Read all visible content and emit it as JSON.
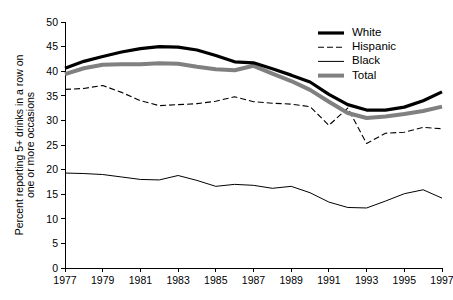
{
  "chart_data": {
    "type": "line",
    "title": "",
    "xlabel": "",
    "ylabel": "Percent reporting 5+ drinks in a row on one or more occasions",
    "ylabel_line1": "Percent reporting 5+ drinks in a row on",
    "ylabel_line2": "one or more occasions",
    "x": [
      1977,
      1978,
      1979,
      1980,
      1981,
      1982,
      1983,
      1984,
      1985,
      1986,
      1987,
      1988,
      1989,
      1990,
      1991,
      1992,
      1993,
      1994,
      1995,
      1996,
      1997
    ],
    "xlim": [
      1977,
      1997
    ],
    "ylim": [
      0,
      50
    ],
    "xticks": [
      1977,
      1979,
      1981,
      1983,
      1985,
      1987,
      1989,
      1991,
      1993,
      1995,
      1997
    ],
    "xtick_labels": [
      "1977",
      "1979",
      "1981",
      "1983",
      "1985",
      "1987",
      "1989",
      "1991",
      "1993",
      "1995",
      "1997"
    ],
    "yticks": [
      0,
      5,
      10,
      15,
      20,
      25,
      30,
      35,
      40,
      45,
      50
    ],
    "ytick_labels": [
      "0",
      "5",
      "10",
      "15",
      "20",
      "25",
      "30",
      "35",
      "40",
      "45",
      "50"
    ],
    "grid": false,
    "legend_position": "top-right",
    "series": [
      {
        "name": "White",
        "style": "solid",
        "color": "#000000",
        "width": 3.2,
        "dash": "none",
        "values": [
          40.6,
          42.0,
          43.0,
          43.9,
          44.6,
          45.0,
          44.9,
          44.3,
          43.2,
          41.9,
          41.7,
          40.5,
          39.2,
          37.8,
          35.3,
          33.2,
          32.1,
          32.1,
          32.7,
          34.0,
          35.8
        ]
      },
      {
        "name": "Hispanic",
        "style": "dashed",
        "color": "#000000",
        "width": 1.1,
        "dash": "6,3",
        "values": [
          36.3,
          36.5,
          37.1,
          35.7,
          34.0,
          33.0,
          33.2,
          33.4,
          33.9,
          34.8,
          33.8,
          33.5,
          33.3,
          32.8,
          29.0,
          32.5,
          25.3,
          27.4,
          27.6,
          28.6,
          28.3
        ]
      },
      {
        "name": "Black",
        "style": "solid",
        "color": "#000000",
        "width": 1.0,
        "dash": "none",
        "values": [
          19.3,
          19.2,
          19.0,
          18.5,
          18.0,
          17.9,
          18.8,
          17.8,
          16.6,
          17.0,
          16.8,
          16.2,
          16.6,
          15.3,
          13.4,
          12.3,
          12.2,
          13.6,
          15.1,
          15.9,
          14.2
        ]
      },
      {
        "name": "Total",
        "style": "solid",
        "color": "#808080",
        "width": 4.0,
        "dash": "none",
        "values": [
          39.4,
          40.6,
          41.3,
          41.4,
          41.4,
          41.6,
          41.5,
          40.9,
          40.4,
          40.2,
          41.1,
          39.5,
          38.0,
          36.2,
          33.8,
          31.5,
          30.5,
          30.8,
          31.3,
          31.9,
          32.8
        ]
      }
    ]
  },
  "legend": {
    "items": [
      {
        "label": "White"
      },
      {
        "label": "Hispanic"
      },
      {
        "label": "Black"
      },
      {
        "label": "Total"
      }
    ]
  },
  "colors": {
    "axis": "#000000",
    "white_series": "#000000",
    "hispanic_series": "#000000",
    "black_series": "#000000",
    "total_series": "#808080",
    "background": "#ffffff"
  }
}
